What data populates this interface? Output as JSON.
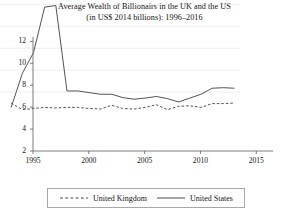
{
  "chart_data": {
    "type": "line",
    "title": "Average Wealth of Billionairs in the UK and the US",
    "subtitle": "(in US$ 2014 billions): 1996–2016",
    "title_lines": [
      "Average Wealth of Billionairs in the UK and the US",
      "(in US$ 2014 billions): 1996–2016"
    ],
    "xlabel": "",
    "ylabel": "",
    "xlim": [
      1995,
      2016.5
    ],
    "ylim": [
      2,
      12.4
    ],
    "xticks": [
      1995,
      2000,
      2005,
      2010,
      2015
    ],
    "yticks": [
      2,
      4,
      6,
      8,
      10,
      12
    ],
    "xtick_labels": [
      "1995",
      "2000",
      "2005",
      "2010",
      "2015"
    ],
    "ytick_labels": [
      "2",
      "4",
      "6",
      "8",
      "10",
      "12"
    ],
    "grid": "horizontal",
    "legend_position": "bottom",
    "x": [
      1996,
      1997,
      1998,
      1999,
      2000,
      2001,
      2002,
      2003,
      2004,
      2005,
      2006,
      2007,
      2008,
      2009,
      2010,
      2011,
      2012,
      2013,
      2014,
      2015,
      2016
    ],
    "series": [
      {
        "name": "United Kingdom",
        "style": "dashed",
        "color": "#4a4a4a",
        "values": [
          3.0,
          2.4,
          2.5,
          2.6,
          2.55,
          2.6,
          2.6,
          2.5,
          2.45,
          2.8,
          2.5,
          2.45,
          2.6,
          2.85,
          2.4,
          2.7,
          2.75,
          2.6,
          2.95,
          2.95,
          3.0
        ]
      },
      {
        "name": "United States",
        "style": "solid",
        "color": "#4a4a4a",
        "values": [
          2.6,
          5.7,
          7.6,
          11.75,
          11.9,
          4.1,
          4.1,
          3.95,
          3.8,
          3.8,
          3.5,
          3.35,
          3.45,
          3.6,
          3.4,
          3.1,
          3.45,
          3.8,
          4.35,
          4.4,
          4.35
        ]
      }
    ]
  },
  "legend": {
    "items": [
      {
        "label": "United Kingdom",
        "style": "dashed"
      },
      {
        "label": "United States",
        "style": "solid"
      }
    ]
  }
}
